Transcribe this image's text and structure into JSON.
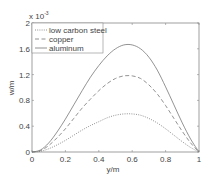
{
  "chart_data": {
    "type": "line",
    "title": "",
    "xlabel": "y/m",
    "ylabel": "w/m",
    "y_multiplier_label": "x 10",
    "y_multiplier_exponent": "-3",
    "xlim": [
      0,
      1
    ],
    "ylim": [
      0,
      0.002
    ],
    "xticks": [
      "0",
      "0.2",
      "0.4",
      "0.6",
      "0.8",
      "1"
    ],
    "yticks": [
      "0",
      "0.4",
      "0.8",
      "1.2",
      "1.6",
      "2"
    ],
    "grid": false,
    "legend_position": "upper left",
    "x": [
      0,
      0.05,
      0.1,
      0.15,
      0.2,
      0.25,
      0.3,
      0.35,
      0.4,
      0.45,
      0.5,
      0.55,
      0.6,
      0.65,
      0.7,
      0.75,
      0.8,
      0.85,
      0.9,
      0.95,
      1.0
    ],
    "series": [
      {
        "name": "low carbon steel",
        "style": "dotted",
        "peak": {
          "x": 0.58,
          "y": 0.00059
        },
        "values": [
          0,
          1e-05,
          5e-05,
          0.00011,
          0.00018,
          0.00026,
          0.00034,
          0.00041,
          0.00047,
          0.00053,
          0.00057,
          0.00059,
          0.00059,
          0.00057,
          0.00052,
          0.00045,
          0.00036,
          0.00026,
          0.00016,
          7e-05,
          0
        ]
      },
      {
        "name": "copper",
        "style": "dashed",
        "peak": {
          "x": 0.58,
          "y": 0.00118
        },
        "values": [
          0,
          2e-05,
          0.0001,
          0.00022,
          0.00036,
          0.00052,
          0.00068,
          0.00082,
          0.00095,
          0.00106,
          0.00114,
          0.00118,
          0.00118,
          0.00114,
          0.00104,
          0.0009,
          0.00072,
          0.00052,
          0.00032,
          0.00014,
          0
        ]
      },
      {
        "name": "aluminum",
        "style": "solid",
        "peak": {
          "x": 0.58,
          "y": 0.00166
        },
        "values": [
          0,
          3e-05,
          0.00014,
          0.00031,
          0.00051,
          0.00073,
          0.00095,
          0.00116,
          0.00134,
          0.00149,
          0.0016,
          0.00166,
          0.00166,
          0.0016,
          0.00147,
          0.00127,
          0.00101,
          0.00073,
          0.00045,
          0.0002,
          0
        ]
      }
    ]
  }
}
